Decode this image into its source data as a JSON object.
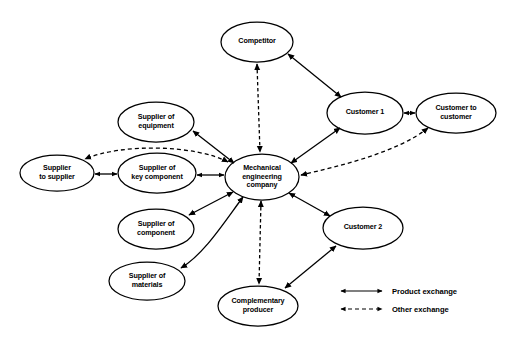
{
  "diagram": {
    "type": "network-diagram",
    "nodes": [
      {
        "id": "competitor",
        "label": "Competitor",
        "cx": 257,
        "cy": 42,
        "rx": 36,
        "ry": 20
      },
      {
        "id": "customer1",
        "label": "Customer 1",
        "cx": 365,
        "cy": 113,
        "rx": 38,
        "ry": 21
      },
      {
        "id": "customer-to-customer",
        "label": "Customer to\ncustomer",
        "cx": 456,
        "cy": 113,
        "rx": 40,
        "ry": 20
      },
      {
        "id": "supplier-equipment",
        "label": "Supplier of\nequipment",
        "cx": 156,
        "cy": 122,
        "rx": 38,
        "ry": 20
      },
      {
        "id": "supplier-to-supplier",
        "label": "Supplier\nto supplier",
        "cx": 57,
        "cy": 173,
        "rx": 37,
        "ry": 18
      },
      {
        "id": "supplier-key-component",
        "label": "Supplier of\nkey component",
        "cx": 157,
        "cy": 173,
        "rx": 39,
        "ry": 20
      },
      {
        "id": "mechanical-engineering-company",
        "label": "Mechanical\nengineering\ncompany",
        "cx": 262,
        "cy": 177,
        "rx": 37,
        "ry": 23
      },
      {
        "id": "supplier-component",
        "label": "Supplier of\ncomponent",
        "cx": 156,
        "cy": 229,
        "rx": 38,
        "ry": 20
      },
      {
        "id": "supplier-materials",
        "label": "Supplier of\nmaterials",
        "cx": 147,
        "cy": 281,
        "rx": 38,
        "ry": 19
      },
      {
        "id": "customer2",
        "label": "Customer 2",
        "cx": 363,
        "cy": 228,
        "rx": 40,
        "ry": 21
      },
      {
        "id": "complementary-producer",
        "label": "Complementary\nproducer",
        "cx": 258,
        "cy": 306,
        "rx": 40,
        "ry": 20
      }
    ],
    "edges": [
      {
        "id": "edge-competitor-company",
        "from": "competitor",
        "to": "mechanical-engineering-company",
        "style": "dashed",
        "arrows": "both"
      },
      {
        "id": "edge-competitor-customer1",
        "from": "competitor",
        "to": "customer1",
        "style": "solid",
        "arrows": "both"
      },
      {
        "id": "edge-customer1-company",
        "from": "customer1",
        "to": "mechanical-engineering-company",
        "style": "solid",
        "arrows": "both"
      },
      {
        "id": "edge-customer1-c2c",
        "from": "customer1",
        "to": "customer-to-customer",
        "style": "solid",
        "arrows": "both"
      },
      {
        "id": "edge-c2c-company",
        "from": "customer-to-customer",
        "to": "mechanical-engineering-company",
        "style": "dashed",
        "arrows": "both"
      },
      {
        "id": "edge-company-supplier-equipment",
        "from": "mechanical-engineering-company",
        "to": "supplier-equipment",
        "style": "solid",
        "arrows": "both"
      },
      {
        "id": "edge-company-supplier-to-supplier",
        "from": "mechanical-engineering-company",
        "to": "supplier-to-supplier",
        "style": "dashed",
        "arrows": "both"
      },
      {
        "id": "edge-supplier-to-supplier-key-component",
        "from": "supplier-to-supplier",
        "to": "supplier-key-component",
        "style": "solid",
        "arrows": "both"
      },
      {
        "id": "edge-key-component-company",
        "from": "supplier-key-component",
        "to": "mechanical-engineering-company",
        "style": "solid",
        "arrows": "both"
      },
      {
        "id": "edge-company-supplier-component",
        "from": "mechanical-engineering-company",
        "to": "supplier-component",
        "style": "solid",
        "arrows": "both"
      },
      {
        "id": "edge-company-supplier-materials",
        "from": "mechanical-engineering-company",
        "to": "supplier-materials",
        "style": "solid",
        "arrows": "both"
      },
      {
        "id": "edge-company-customer2",
        "from": "mechanical-engineering-company",
        "to": "customer2",
        "style": "solid",
        "arrows": "both"
      },
      {
        "id": "edge-company-complementary-producer",
        "from": "mechanical-engineering-company",
        "to": "complementary-producer",
        "style": "dashed",
        "arrows": "both"
      },
      {
        "id": "edge-complementary-producer-customer2",
        "from": "complementary-producer",
        "to": "customer2",
        "style": "solid",
        "arrows": "both"
      }
    ]
  },
  "legend": {
    "items": [
      {
        "id": "legend-product-exchange",
        "label": "Product exchange",
        "style": "solid"
      },
      {
        "id": "legend-other-exchange",
        "label": "Other exchange",
        "style": "dashed"
      }
    ]
  },
  "colors": {
    "stroke": "#000000",
    "background": "#ffffff",
    "text": "#000000"
  }
}
